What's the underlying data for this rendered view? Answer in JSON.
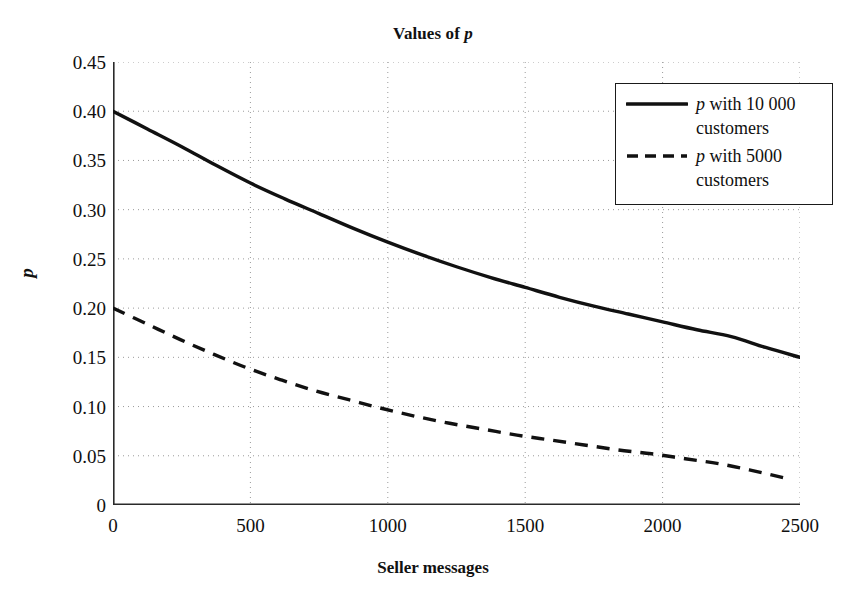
{
  "chart_data": {
    "type": "line",
    "title": "Values of p",
    "title_plain": "Values of p",
    "xlabel": "Seller messages",
    "ylabel": "p",
    "xlim": [
      0,
      2500
    ],
    "ylim": [
      0,
      0.45
    ],
    "grid": true,
    "legend_position": "top-right",
    "xticks": [
      0,
      500,
      1000,
      1500,
      2000,
      2500
    ],
    "xtick_labels": [
      "0",
      "500",
      "1000",
      "1500",
      "2000",
      "2500"
    ],
    "yticks": [
      0,
      0.05,
      0.1,
      0.15,
      0.2,
      0.25,
      0.3,
      0.35,
      0.4,
      0.45
    ],
    "ytick_labels": [
      "0",
      "0.05",
      "0.10",
      "0.15",
      "0.20",
      "0.25",
      "0.30",
      "0.35",
      "0.40",
      "0.45"
    ],
    "x": [
      0,
      125,
      250,
      375,
      500,
      625,
      750,
      875,
      1000,
      1125,
      1250,
      1375,
      1500,
      1625,
      1750,
      1875,
      2000,
      2125,
      2250,
      2375,
      2500
    ],
    "series": [
      {
        "name": "p with 10 000 customers",
        "style": "solid",
        "color": "#111111",
        "values": [
          0.4,
          0.382,
          0.364,
          0.345,
          0.327,
          0.311,
          0.296,
          0.281,
          0.267,
          0.254,
          0.242,
          0.231,
          0.221,
          0.211,
          0.202,
          0.194,
          0.186,
          0.178,
          0.171,
          0.16,
          0.15
        ]
      },
      {
        "name": "p with 5000 customers",
        "style": "dashed",
        "color": "#111111",
        "x_end": 2450,
        "values": [
          0.2,
          0.184,
          0.168,
          0.153,
          0.139,
          0.127,
          0.116,
          0.107,
          0.098,
          0.09,
          0.083,
          0.077,
          0.071,
          0.066,
          0.061,
          0.056,
          0.052,
          0.047,
          0.042,
          0.035,
          0.027
        ]
      }
    ]
  },
  "title": {
    "prefix": "Values of ",
    "italic": "p"
  },
  "axes": {
    "y_title": "p",
    "x_title": "Seller messages"
  },
  "legend": {
    "entries": [
      {
        "prefix": "",
        "italic": "p",
        "suffix": " with 10 000 customers",
        "style": "solid"
      },
      {
        "prefix": "",
        "italic": "p",
        "suffix": " with 5000 customers",
        "style": "dashed"
      }
    ],
    "entry0_italic": "p",
    "entry0_suffix": " with 10 000 customers",
    "entry1_italic": "p",
    "entry1_suffix": " with 5000 customers"
  }
}
